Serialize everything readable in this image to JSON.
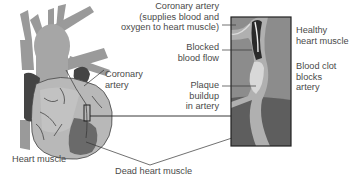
{
  "diagram": {
    "colors": {
      "heart_light": "#b8b8b8",
      "heart_mid": "#a3a3a3",
      "heart_dark": "#444444",
      "dead_muscle": "#6a6a6a",
      "vessel_gray": "#9a9a9a",
      "inset_bg": "#8c8c8c",
      "inset_dead": "#5e5e5e",
      "plaque": "#d8d8d8",
      "clot": "#2a2a2a",
      "text": "#4a4a4a",
      "leader": "#333333"
    },
    "labels": {
      "coronary_artery_inset": [
        "Coronary artery",
        "(supplies blood and",
        "oxygen to heart muscle)"
      ],
      "blocked_blood_flow": [
        "Blocked",
        "blood flow"
      ],
      "plaque_buildup": [
        "Plaque",
        "buildup",
        "in artery"
      ],
      "healthy_heart_muscle": [
        "Healthy",
        "heart muscle"
      ],
      "blood_clot": [
        "Blood clot",
        "blocks",
        "artery"
      ],
      "coronary_artery": [
        "Coronary",
        "artery"
      ],
      "heart_muscle": "Heart muscle",
      "dead_heart_muscle": "Dead heart muscle"
    }
  }
}
